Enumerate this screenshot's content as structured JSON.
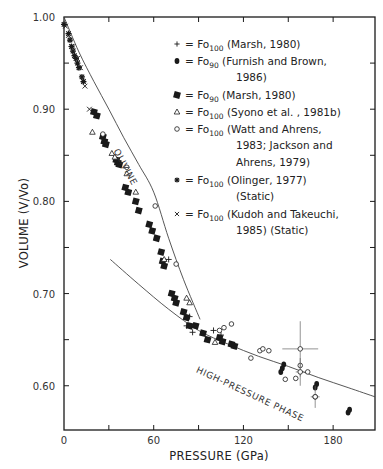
{
  "chart_data": {
    "type": "scatter",
    "title": "",
    "xlabel": "PRESSURE (GPa)",
    "ylabel": "VOLUME (V/Vo)",
    "xlim": [
      0,
      208
    ],
    "ylim": [
      0.552,
      1.0
    ],
    "x_ticks": [
      0,
      60,
      120,
      180
    ],
    "x_minor_ticks": [
      30,
      90,
      150
    ],
    "y_ticks": [
      0.6,
      0.7,
      0.8,
      0.9,
      1.0
    ],
    "y_tick_labels": [
      "0.60",
      "0.70",
      "0.80",
      "0.90",
      "1.00"
    ],
    "y_minor_ticks": [
      0.65,
      0.75,
      0.85,
      0.95
    ],
    "grid": false,
    "legend_position": "upper right (inside)",
    "legend": [
      {
        "marker": "+",
        "text": "= Fo",
        "sub": "100",
        "ref": "(Marsh,  1980)",
        "cont": []
      },
      {
        "marker": "filled-circle",
        "text": "= Fo",
        "sub": "90",
        "ref": "(Furnish and Brown,",
        "cont": [
          "1986)"
        ]
      },
      {
        "marker": "filled-square",
        "text": "= Fo",
        "sub": "90",
        "ref": "(Marsh,  1980)",
        "cont": []
      },
      {
        "marker": "open-triangle",
        "text": "= Fo",
        "sub": "100",
        "ref": "(Syono et al. ,  1981b)",
        "cont": []
      },
      {
        "marker": "open-circle",
        "text": "= Fo",
        "sub": "100",
        "ref": "(Watt and Ahrens,",
        "cont": [
          "1983; Jackson and",
          "Ahrens,  1979)"
        ]
      },
      {
        "marker": "asterisk",
        "text": "= Fo",
        "sub": "100",
        "ref": "(Olinger,  1977)",
        "cont": [
          "(Static)"
        ]
      },
      {
        "marker": "x",
        "text": "= Fo",
        "sub": "100",
        "ref": "(Kudoh and Takeuchi,",
        "cont": [
          "1985)  (Static)"
        ]
      }
    ],
    "annotations": [
      {
        "text": "OLIVINE",
        "x": 33,
        "y": 0.855,
        "rotation": 62
      },
      {
        "text": "HIGH-PRESSURE PHASE",
        "x": 88,
        "y": 0.615,
        "rotation": 25
      }
    ],
    "curves": [
      {
        "name": "olivine",
        "x": [
          0,
          10,
          20,
          30,
          40,
          50,
          60,
          70,
          80,
          91
        ],
        "y": [
          1.0,
          0.962,
          0.93,
          0.9,
          0.869,
          0.84,
          0.81,
          0.76,
          0.715,
          0.672
        ]
      },
      {
        "name": "high-pressure phase",
        "x": [
          31,
          50,
          70,
          90,
          110,
          130,
          150,
          170,
          190,
          208
        ],
        "y": [
          0.737,
          0.71,
          0.683,
          0.66,
          0.645,
          0.632,
          0.621,
          0.609,
          0.598,
          0.588
        ]
      }
    ],
    "series": [
      {
        "name": "Fo100 (Marsh, 1980)",
        "marker": "+",
        "x": [
          70,
          82,
          84,
          86,
          100,
          105
        ],
        "y": [
          0.737,
          0.665,
          0.675,
          0.658,
          0.66,
          0.655
        ]
      },
      {
        "name": "Fo90 (Furnish and Brown, 1986)",
        "marker": "filled-circle",
        "x": [
          145,
          146,
          147,
          168,
          169,
          190,
          191
        ],
        "y": [
          0.615,
          0.619,
          0.623,
          0.598,
          0.602,
          0.571,
          0.574
        ]
      },
      {
        "name": "Fo90 (Marsh, 1980)",
        "marker": "filled-square",
        "x": [
          20,
          22,
          26,
          27,
          28,
          35,
          36,
          37,
          41,
          43,
          48,
          50,
          57,
          59,
          62,
          65,
          66,
          67,
          72,
          74,
          75,
          80,
          82,
          84,
          88,
          93,
          96,
          104,
          106,
          112,
          114
        ],
        "y": [
          0.897,
          0.893,
          0.87,
          0.865,
          0.862,
          0.845,
          0.842,
          0.84,
          0.815,
          0.81,
          0.8,
          0.79,
          0.775,
          0.768,
          0.76,
          0.745,
          0.735,
          0.73,
          0.7,
          0.695,
          0.69,
          0.68,
          0.674,
          0.665,
          0.665,
          0.657,
          0.65,
          0.652,
          0.648,
          0.645,
          0.643
        ]
      },
      {
        "name": "Fo100 (Syono et al., 1981b)",
        "marker": "open-triangle",
        "x": [
          19,
          32,
          34,
          42,
          48,
          67,
          82,
          84,
          101
        ],
        "y": [
          0.875,
          0.852,
          0.848,
          0.83,
          0.81,
          0.737,
          0.695,
          0.69,
          0.647
        ]
      },
      {
        "name": "Fo100 (Watt and Ahrens, 1983; Jackson and Ahrens, 1979)",
        "marker": "open-circle",
        "x": [
          26,
          42,
          61,
          75,
          104,
          107,
          112,
          125,
          131,
          133,
          137,
          148,
          155,
          158,
          163,
          168
        ],
        "y": [
          0.873,
          0.837,
          0.795,
          0.732,
          0.66,
          0.663,
          0.667,
          0.63,
          0.638,
          0.64,
          0.638,
          0.607,
          0.608,
          0.622,
          0.615,
          0.588
        ]
      },
      {
        "name": "Fo100 (Olinger, 1977) (Static)",
        "marker": "asterisk",
        "x": [
          0,
          3,
          4,
          5,
          6,
          7,
          8,
          9,
          10,
          12,
          13
        ],
        "y": [
          0.992,
          0.982,
          0.975,
          0.968,
          0.963,
          0.958,
          0.955,
          0.95,
          0.945,
          0.935,
          0.93
        ]
      },
      {
        "name": "Fo100 (Kudoh and Takeuchi, 1985) (Static)",
        "marker": "x",
        "x": [
          1,
          3,
          6,
          9,
          11,
          14,
          17
        ],
        "y": [
          0.99,
          0.98,
          0.968,
          0.955,
          0.945,
          0.925,
          0.9
        ]
      },
      {
        "name": "error-bar points",
        "marker": "open-circle-errorbar",
        "x": [
          158,
          158,
          168
        ],
        "y": [
          0.64,
          0.615,
          0.588
        ],
        "x_err": [
          12,
          3,
          3
        ],
        "y_err": [
          0.03,
          0.015,
          0.012
        ]
      }
    ]
  }
}
